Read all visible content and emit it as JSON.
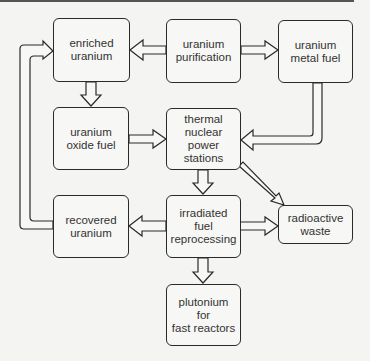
{
  "diagram": {
    "title": "",
    "type": "flowchart",
    "nodes": [
      {
        "id": "enriched",
        "label": "enriched\nuranium"
      },
      {
        "id": "purification",
        "label": "uranium\npurification"
      },
      {
        "id": "metal_fuel",
        "label": "uranium\nmetal fuel"
      },
      {
        "id": "oxide_fuel",
        "label": "uranium\noxide fuel"
      },
      {
        "id": "thermal",
        "label": "thermal\nnuclear\npower\nstations"
      },
      {
        "id": "recovered",
        "label": "recovered\nuranium"
      },
      {
        "id": "reprocessing",
        "label": "irradiated\nfuel\nreprocessing"
      },
      {
        "id": "waste",
        "label": "radioactive\nwaste"
      },
      {
        "id": "plutonium",
        "label": "plutonium\nfor\nfast reactors"
      }
    ],
    "edges": [
      {
        "from": "purification",
        "to": "enriched"
      },
      {
        "from": "purification",
        "to": "metal_fuel"
      },
      {
        "from": "enriched",
        "to": "oxide_fuel"
      },
      {
        "from": "oxide_fuel",
        "to": "thermal"
      },
      {
        "from": "metal_fuel",
        "to": "thermal"
      },
      {
        "from": "thermal",
        "to": "reprocessing"
      },
      {
        "from": "thermal",
        "to": "waste"
      },
      {
        "from": "reprocessing",
        "to": "waste"
      },
      {
        "from": "reprocessing",
        "to": "recovered"
      },
      {
        "from": "reprocessing",
        "to": "plutonium"
      },
      {
        "from": "recovered",
        "to": "enriched"
      }
    ],
    "colors": {
      "line": "#2a2a2a",
      "background": "#f4f4f2",
      "text": "#333333"
    }
  }
}
